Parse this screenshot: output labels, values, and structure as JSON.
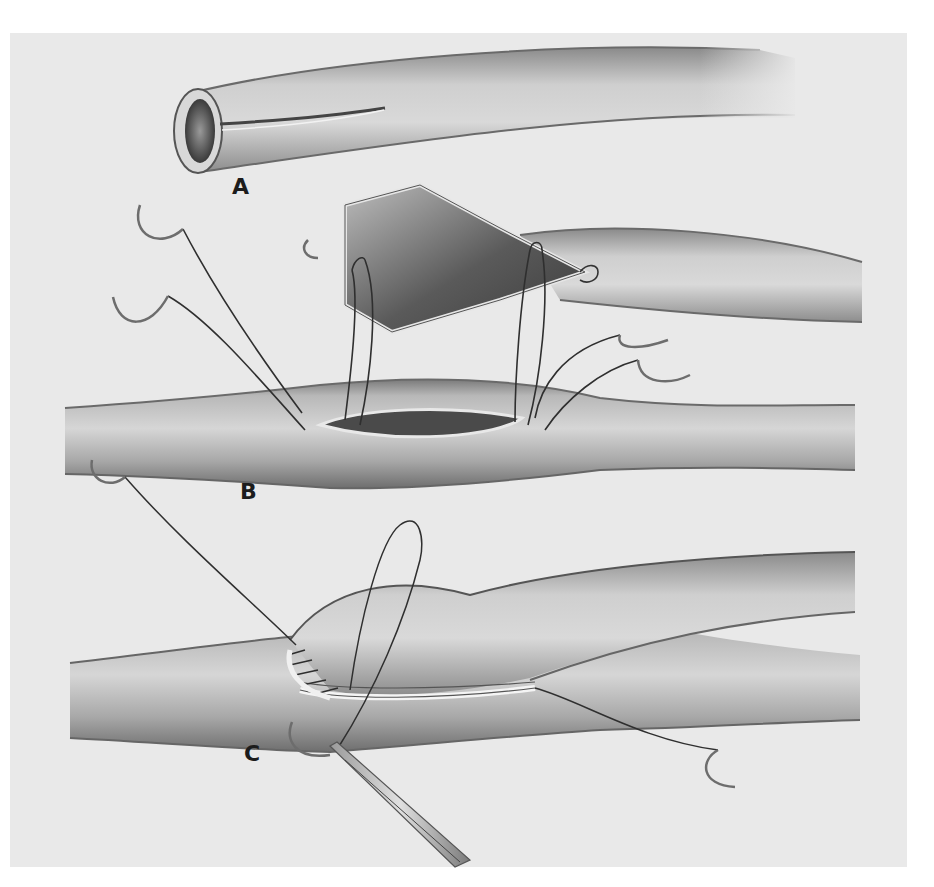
{
  "figure": {
    "background_color": "#e9e9e9",
    "page_color": "#ffffff",
    "ink_color": "#2a2a2a",
    "panels": [
      {
        "id": "A",
        "label": "A",
        "description": "Graft vessel end with longitudinal slit incision"
      },
      {
        "id": "B",
        "label": "B",
        "description": "Spatulated graft end with stay sutures placed into elliptical arteriotomy of recipient vessel"
      },
      {
        "id": "C",
        "label": "C",
        "description": "Running suture completing anastomosis; needle holder grasping needle"
      }
    ],
    "elements": {
      "needles": [
        "suture-needle-b-left-upper",
        "suture-needle-b-left-lower",
        "suture-needle-b-right-upper",
        "suture-needle-b-right-lower",
        "suture-needle-c-top-left",
        "suture-needle-c-right",
        "suture-needle-c-bottom"
      ],
      "instrument": "needle-holder"
    }
  }
}
